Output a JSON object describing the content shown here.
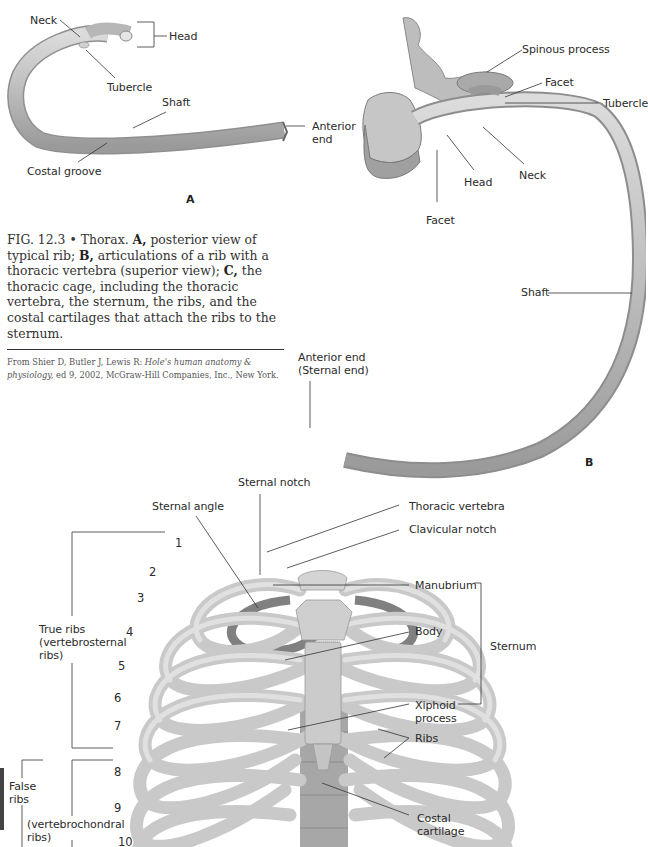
{
  "figure": {
    "number": "FIG. 12.3",
    "bullet": "•",
    "caption_parts": [
      {
        "text": "Thorax. ",
        "bold": false
      },
      {
        "text": "A,",
        "bold": true
      },
      {
        "text": " posterior view of typical rib; ",
        "bold": false
      },
      {
        "text": "B,",
        "bold": true
      },
      {
        "text": " articulations of a rib with a thoracic vertebra (superior view); ",
        "bold": false
      },
      {
        "text": "C,",
        "bold": true
      },
      {
        "text": " the thoracic cage, including the thoracic vertebra, the sternum, the ribs, and the costal cartilages that attach the ribs to the sternum.",
        "bold": false
      }
    ],
    "source": {
      "prefix": "From Shier D, Butler J, Lewis R: ",
      "title": "Hole's human anatomy & physiology,",
      "suffix": " ed 9, 2002, McGraw-Hill Companies, Inc., New York."
    }
  },
  "panel_a": {
    "letter": "A",
    "labels": {
      "neck": "Neck",
      "head": "Head",
      "tubercle": "Tubercle",
      "shaft": "Shaft",
      "anterior_end_1": "Anterior",
      "anterior_end_2": "end",
      "costal_groove": "Costal groove"
    }
  },
  "panel_b": {
    "letter": "B",
    "labels": {
      "spinous_process": "Spinous process",
      "facet_top": "Facet",
      "tubercle": "Tubercle",
      "neck": "Neck",
      "head": "Head",
      "facet_bottom": "Facet",
      "shaft": "Shaft",
      "anterior_end_1": "Anterior end",
      "anterior_end_2": "(Sternal end)"
    }
  },
  "panel_c": {
    "labels": {
      "sternal_notch": "Sternal notch",
      "sternal_angle": "Sternal angle",
      "thoracic_vertebra": "Thoracic vertebra",
      "clavicular_notch": "Clavicular notch",
      "manubrium": "Manubrium",
      "body": "Body",
      "sternum": "Sternum",
      "xiphoid_1": "Xiphoid",
      "xiphoid_2": "process",
      "ribs": "Ribs",
      "costal_1": "Costal",
      "costal_2": "cartilage",
      "true_ribs_1": "True ribs",
      "true_ribs_2": "(vertebrosternal",
      "true_ribs_3": "ribs)",
      "false_ribs_1": "False",
      "false_ribs_2": "ribs",
      "vc_1": "(vertebrochondral",
      "vc_2": "ribs)"
    },
    "rib_numbers": [
      "1",
      "2",
      "3",
      "4",
      "5",
      "6",
      "7",
      "8",
      "9",
      "10"
    ]
  },
  "colors": {
    "bone": "#c9c9c9",
    "bone_dark": "#8e8e8e",
    "bone_light": "#e4e4e4",
    "leader": "#333333",
    "background": "#ffffff"
  }
}
